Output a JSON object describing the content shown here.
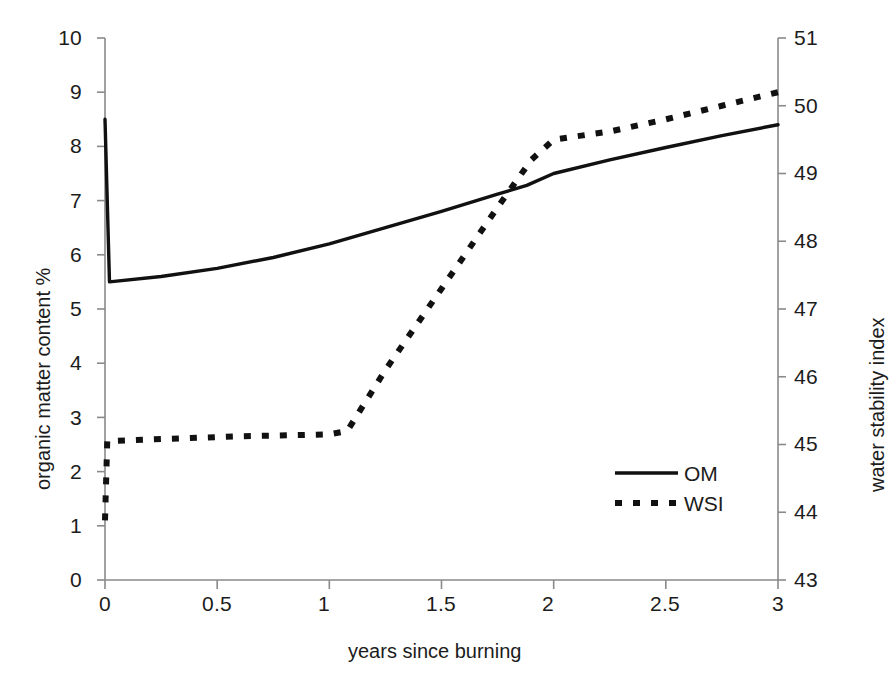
{
  "chart_data": {
    "type": "line",
    "title": "",
    "xlabel": "years since burning",
    "ylabel": "organic matter content %",
    "y2label": "water stability index",
    "xlim": [
      0,
      3
    ],
    "ylim": [
      0,
      10
    ],
    "y2lim": [
      43,
      51
    ],
    "xticks": [
      0,
      0.5,
      1,
      1.5,
      2,
      2.5,
      3
    ],
    "xtick_labels": [
      "0",
      "0.5",
      "1",
      "1.5",
      "2",
      "2.5",
      "3"
    ],
    "yticks": [
      0,
      1,
      2,
      3,
      4,
      5,
      6,
      7,
      8,
      9,
      10
    ],
    "ytick_labels": [
      "0",
      "1",
      "2",
      "3",
      "4",
      "5",
      "6",
      "7",
      "8",
      "9",
      "10"
    ],
    "y2ticks": [
      43,
      44,
      45,
      46,
      47,
      48,
      49,
      50,
      51
    ],
    "y2tick_labels": [
      "43",
      "44",
      "45",
      "46",
      "47",
      "48",
      "49",
      "50",
      "51"
    ],
    "grid": false,
    "legend_position": "center-right",
    "series": [
      {
        "name": "OM",
        "axis": "left",
        "style": "solid",
        "color": "#111111",
        "points": [
          {
            "x": 0.0,
            "y": 8.5
          },
          {
            "x": 0.02,
            "y": 5.5
          },
          {
            "x": 0.25,
            "y": 5.6
          },
          {
            "x": 0.5,
            "y": 5.75
          },
          {
            "x": 0.75,
            "y": 5.95
          },
          {
            "x": 1.0,
            "y": 6.2
          },
          {
            "x": 1.25,
            "y": 6.5
          },
          {
            "x": 1.5,
            "y": 6.8
          },
          {
            "x": 1.75,
            "y": 7.12
          },
          {
            "x": 1.88,
            "y": 7.28
          },
          {
            "x": 2.0,
            "y": 7.5
          },
          {
            "x": 2.25,
            "y": 7.75
          },
          {
            "x": 2.5,
            "y": 7.98
          },
          {
            "x": 2.75,
            "y": 8.2
          },
          {
            "x": 3.0,
            "y": 8.4
          }
        ]
      },
      {
        "name": "WSI",
        "axis": "right",
        "style": "dashed",
        "color": "#111111",
        "points": [
          {
            "x": 0.0,
            "y": 43.88
          },
          {
            "x": 0.01,
            "y": 45.05
          },
          {
            "x": 0.25,
            "y": 45.08
          },
          {
            "x": 0.6,
            "y": 45.12
          },
          {
            "x": 1.0,
            "y": 45.15
          },
          {
            "x": 1.08,
            "y": 45.2
          },
          {
            "x": 1.25,
            "y": 46.1
          },
          {
            "x": 1.5,
            "y": 47.3
          },
          {
            "x": 1.75,
            "y": 48.5
          },
          {
            "x": 1.9,
            "y": 49.2
          },
          {
            "x": 2.0,
            "y": 49.5
          },
          {
            "x": 2.25,
            "y": 49.62
          },
          {
            "x": 2.5,
            "y": 49.8
          },
          {
            "x": 2.75,
            "y": 50.0
          },
          {
            "x": 3.0,
            "y": 50.2
          }
        ]
      }
    ],
    "legend": [
      {
        "label": "OM",
        "style": "solid"
      },
      {
        "label": "WSI",
        "style": "dashed"
      }
    ]
  },
  "axes": {
    "left_title": "organic matter content %",
    "right_title": "water stability index",
    "bottom_title": "years since burning"
  },
  "legend": {
    "om_label": "OM",
    "wsi_label": "WSI"
  },
  "colors": {
    "line": "#111111",
    "axis": "#8a8a8a",
    "text": "#1c1c1c",
    "background": "#ffffff"
  }
}
